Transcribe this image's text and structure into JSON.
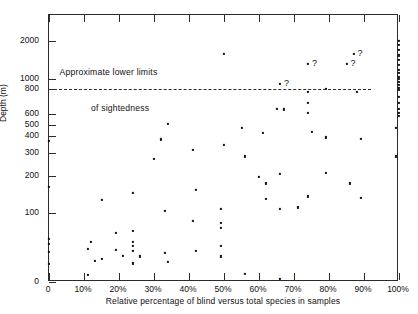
{
  "chart_data": {
    "type": "scatter",
    "title": "",
    "xlabel": "Relative percentage of blind versus total species in samples",
    "ylabel": "Depth (m)",
    "xlim": [
      0,
      100
    ],
    "ylim": [
      0,
      2400
    ],
    "yscale": "log-like (depth)",
    "grid": false,
    "legend": null,
    "x_ticks": [
      {
        "value": 0,
        "label": "0"
      },
      {
        "value": 10,
        "label": "10%"
      },
      {
        "value": 20,
        "label": "20%"
      },
      {
        "value": 30,
        "label": "30%"
      },
      {
        "value": 40,
        "label": "40%"
      },
      {
        "value": 50,
        "label": "50%"
      },
      {
        "value": 60,
        "label": "60%"
      },
      {
        "value": 70,
        "label": "70%"
      },
      {
        "value": 80,
        "label": "80%"
      },
      {
        "value": 90,
        "label": "90%"
      },
      {
        "value": 100,
        "label": "100%"
      }
    ],
    "y_ticks": [
      {
        "value": 2000,
        "label": "2000"
      },
      {
        "value": 1000,
        "label": "1000"
      },
      {
        "value": 800,
        "label": "800"
      },
      {
        "value": 600,
        "label": "600"
      },
      {
        "value": 500,
        "label": "500"
      },
      {
        "value": 400,
        "label": "400"
      },
      {
        "value": 300,
        "label": "300"
      },
      {
        "value": 200,
        "label": "200"
      },
      {
        "value": 100,
        "label": "100"
      },
      {
        "value": 0,
        "label": "0"
      }
    ],
    "annotations": [
      {
        "name": "sightedness-limit-line",
        "type": "hline",
        "value": 800,
        "style": "dashed"
      },
      {
        "name": "sightedness-caption-line1",
        "text": "Approximate lower limits",
        "x": 3,
        "y": 1150
      },
      {
        "name": "sightedness-caption-line2",
        "text": "of sightedness",
        "x": 12,
        "y": 640
      }
    ],
    "uncertain_marker": "?",
    "points": [
      {
        "x": 0,
        "y": 370
      },
      {
        "x": 0,
        "y": 170
      },
      {
        "x": 0,
        "y": 62
      },
      {
        "x": 0,
        "y": 55
      },
      {
        "x": 0,
        "y": 44
      },
      {
        "x": 0,
        "y": 26
      },
      {
        "x": 11,
        "y": 48
      },
      {
        "x": 11,
        "y": 10
      },
      {
        "x": 12,
        "y": 58
      },
      {
        "x": 13,
        "y": 30
      },
      {
        "x": 15,
        "y": 135
      },
      {
        "x": 15,
        "y": 33
      },
      {
        "x": 19,
        "y": 71
      },
      {
        "x": 19,
        "y": 47
      },
      {
        "x": 21,
        "y": 38
      },
      {
        "x": 24,
        "y": 155
      },
      {
        "x": 24,
        "y": 74
      },
      {
        "x": 24,
        "y": 58
      },
      {
        "x": 24,
        "y": 52
      },
      {
        "x": 24,
        "y": 45
      },
      {
        "x": 24,
        "y": 27
      },
      {
        "x": 26,
        "y": 37
      },
      {
        "x": 30,
        "y": 275
      },
      {
        "x": 32,
        "y": 380
      },
      {
        "x": 33,
        "y": 106
      },
      {
        "x": 33,
        "y": 42
      },
      {
        "x": 34,
        "y": 510
      },
      {
        "x": 34,
        "y": 29
      },
      {
        "x": 41,
        "y": 320
      },
      {
        "x": 41,
        "y": 88
      },
      {
        "x": 42,
        "y": 163
      },
      {
        "x": 42,
        "y": 45
      },
      {
        "x": 49,
        "y": 112
      },
      {
        "x": 49,
        "y": 86
      },
      {
        "x": 49,
        "y": 78
      },
      {
        "x": 49,
        "y": 52
      },
      {
        "x": 49,
        "y": 37
      },
      {
        "x": 50,
        "y": 1650
      },
      {
        "x": 50,
        "y": 350
      },
      {
        "x": 55,
        "y": 475
      },
      {
        "x": 56,
        "y": 285
      },
      {
        "x": 56,
        "y": 12
      },
      {
        "x": 60,
        "y": 197
      },
      {
        "x": 61,
        "y": 430
      },
      {
        "x": 62,
        "y": 180
      },
      {
        "x": 62,
        "y": 138
      },
      {
        "x": 65,
        "y": 640
      },
      {
        "x": 66,
        "y": 900
      },
      {
        "x": 66,
        "y": 210
      },
      {
        "x": 66,
        "y": 112
      },
      {
        "x": 66,
        "y": 4
      },
      {
        "x": 67,
        "y": 637
      },
      {
        "x": 71,
        "y": 115
      },
      {
        "x": 74,
        "y": 1400
      },
      {
        "x": 74,
        "y": 780
      },
      {
        "x": 74,
        "y": 690
      },
      {
        "x": 74,
        "y": 610
      },
      {
        "x": 74,
        "y": 145
      },
      {
        "x": 75,
        "y": 440
      },
      {
        "x": 79,
        "y": 800
      },
      {
        "x": 79,
        "y": 392
      },
      {
        "x": 79,
        "y": 215
      },
      {
        "x": 85,
        "y": 1390
      },
      {
        "x": 86,
        "y": 180
      },
      {
        "x": 87,
        "y": 1650
      },
      {
        "x": 88,
        "y": 780
      },
      {
        "x": 89,
        "y": 383
      },
      {
        "x": 89,
        "y": 140
      },
      {
        "x": 99,
        "y": 285
      },
      {
        "x": 99,
        "y": 470
      },
      {
        "x": 100,
        "y": 2000
      },
      {
        "x": 100,
        "y": 1900
      },
      {
        "x": 100,
        "y": 1760
      },
      {
        "x": 100,
        "y": 1620
      },
      {
        "x": 100,
        "y": 1500
      },
      {
        "x": 100,
        "y": 1380
      },
      {
        "x": 100,
        "y": 1250
      },
      {
        "x": 100,
        "y": 1150
      },
      {
        "x": 100,
        "y": 1060
      },
      {
        "x": 100,
        "y": 1000
      },
      {
        "x": 100,
        "y": 940
      },
      {
        "x": 100,
        "y": 880
      },
      {
        "x": 100,
        "y": 830
      },
      {
        "x": 100,
        "y": 790
      },
      {
        "x": 100,
        "y": 740
      },
      {
        "x": 100,
        "y": 690
      },
      {
        "x": 100,
        "y": 640
      },
      {
        "x": 100,
        "y": 610
      },
      {
        "x": 100,
        "y": 580
      }
    ],
    "uncertain_points": [
      {
        "x": 66,
        "y": 900,
        "label": "?"
      },
      {
        "x": 74,
        "y": 1400,
        "label": "?"
      },
      {
        "x": 85,
        "y": 1390,
        "label": "?"
      },
      {
        "x": 87,
        "y": 1650,
        "label": "?"
      }
    ]
  }
}
